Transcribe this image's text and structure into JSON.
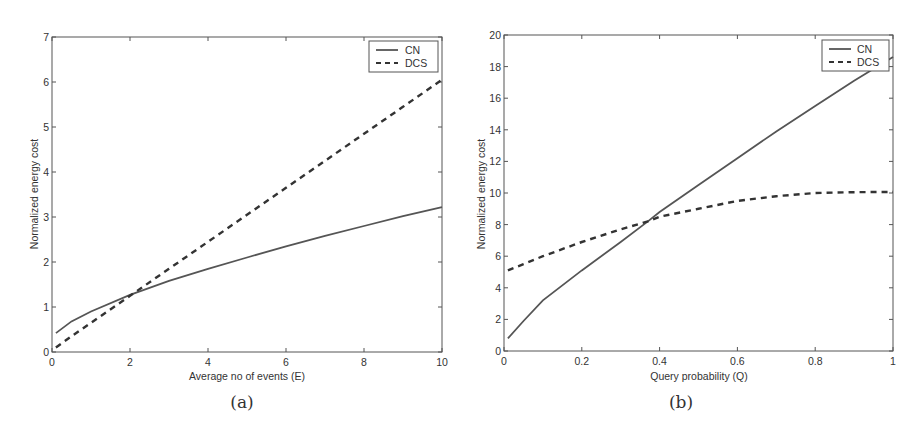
{
  "chart_data": [
    {
      "type": "line",
      "panel": "a",
      "caption": "(a)",
      "title": "",
      "xlabel": "Average no of events (E)",
      "ylabel": "Normalized energy cost",
      "xlim": [
        0,
        10
      ],
      "ylim": [
        0,
        7
      ],
      "xticks": [
        0,
        2,
        4,
        6,
        8,
        10
      ],
      "yticks": [
        0,
        1,
        2,
        3,
        4,
        5,
        6,
        7
      ],
      "grid": false,
      "legend_position": "upper right",
      "x": [
        0.1,
        0.5,
        1,
        2,
        3,
        4,
        5,
        6,
        7,
        8,
        9,
        10
      ],
      "series": [
        {
          "name": "CN",
          "style": "solid",
          "values": [
            0.42,
            0.68,
            0.9,
            1.27,
            1.58,
            1.85,
            2.1,
            2.35,
            2.58,
            2.8,
            3.02,
            3.22
          ]
        },
        {
          "name": "DCS",
          "style": "dashed",
          "values": [
            0.1,
            0.35,
            0.65,
            1.25,
            1.85,
            2.45,
            3.05,
            3.65,
            4.25,
            4.85,
            5.45,
            6.05
          ]
        }
      ]
    },
    {
      "type": "line",
      "panel": "b",
      "caption": "(b)",
      "title": "",
      "xlabel": "Query probability (Q)",
      "ylabel": "Normalized energy cost",
      "xlim": [
        0,
        1
      ],
      "ylim": [
        0,
        20
      ],
      "xticks": [
        0,
        0.2,
        0.4,
        0.6,
        0.8,
        1
      ],
      "yticks": [
        0,
        2,
        4,
        6,
        8,
        10,
        12,
        14,
        16,
        18,
        20
      ],
      "grid": false,
      "legend_position": "upper right",
      "x": [
        0.01,
        0.05,
        0.1,
        0.2,
        0.3,
        0.37,
        0.4,
        0.5,
        0.6,
        0.7,
        0.8,
        0.9,
        1.0
      ],
      "series": [
        {
          "name": "CN",
          "style": "solid",
          "values": [
            0.8,
            1.9,
            3.2,
            5.1,
            6.9,
            8.2,
            8.8,
            10.5,
            12.2,
            13.9,
            15.5,
            17.1,
            18.6
          ]
        },
        {
          "name": "DCS",
          "style": "dashed",
          "values": [
            5.1,
            5.5,
            6.0,
            6.9,
            7.7,
            8.2,
            8.5,
            9.0,
            9.5,
            9.8,
            10.0,
            10.05,
            10.07
          ]
        }
      ]
    }
  ],
  "panels": {
    "a": {
      "caption": "(a)",
      "xlabel": "Average no of events (E)",
      "ylabel": "Normalized energy cost",
      "legend": {
        "cn": "CN",
        "dcs": "DCS"
      },
      "xticks": [
        "0",
        "2",
        "4",
        "6",
        "8",
        "10"
      ],
      "yticks": [
        "0",
        "1",
        "2",
        "3",
        "4",
        "5",
        "6",
        "7"
      ]
    },
    "b": {
      "caption": "(b)",
      "xlabel": "Query probability (Q)",
      "ylabel": "Normalized energy cost",
      "legend": {
        "cn": "CN",
        "dcs": "DCS"
      },
      "xticks": [
        "0",
        "0.2",
        "0.4",
        "0.6",
        "0.8",
        "1"
      ],
      "yticks": [
        "0",
        "2",
        "4",
        "6",
        "8",
        "10",
        "12",
        "14",
        "16",
        "18",
        "20"
      ]
    }
  },
  "colors": {
    "line": "#555555",
    "axis": "#444444",
    "text": "#333333"
  }
}
